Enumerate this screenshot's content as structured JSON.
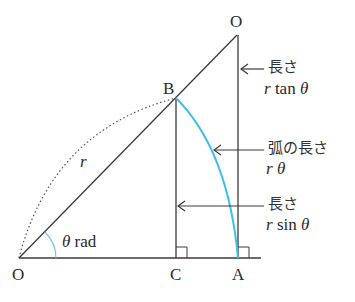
{
  "diagram": {
    "points": {
      "O_origin": {
        "label": "O",
        "x": 19,
        "y": 258
      },
      "O_top": {
        "label": "O",
        "x": 237,
        "y": 35
      },
      "B": {
        "label": "B",
        "x": 176,
        "y": 98
      },
      "C": {
        "label": "C",
        "x": 176,
        "y": 258
      },
      "A": {
        "label": "A",
        "x": 238,
        "y": 258
      }
    },
    "labels": {
      "origin": "O",
      "top": "O",
      "b": "B",
      "c": "C",
      "a": "A",
      "radius": "r",
      "angle_symbol": "θ",
      "angle_unit": "rad",
      "tan_label_jp": "長さ",
      "tan_expr_r": "r",
      "tan_expr_fn": "tan",
      "tan_expr_theta": "θ",
      "arc_label_jp": "弧の長さ",
      "arc_expr_r": "r",
      "arc_expr_theta": "θ",
      "sin_label_jp": "長さ",
      "sin_expr_r": "r",
      "sin_expr_fn": "sin",
      "sin_expr_theta": "θ"
    },
    "colors": {
      "line": "#3a3a3a",
      "arc": "#3fc0e6",
      "angle_arc": "#6cc5e3"
    }
  }
}
